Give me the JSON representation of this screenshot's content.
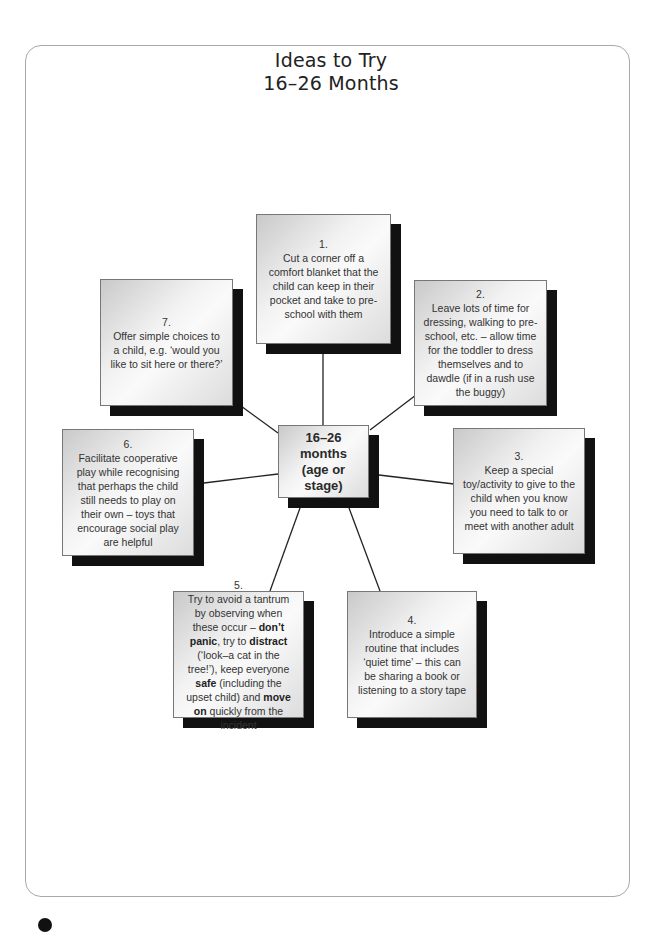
{
  "title": {
    "line1": "Ideas to Try",
    "line2": "16–26 Months"
  },
  "center": {
    "line1": "16–26",
    "line2": "months",
    "line3": "(age or stage)"
  },
  "ideas": [
    {
      "number": "1.",
      "segments": [
        {
          "text": "Cut a corner off a comfort blanket that the child can keep in their pocket and take to pre-school with them",
          "bold": false
        }
      ]
    },
    {
      "number": "2.",
      "segments": [
        {
          "text": "Leave lots of time for dressing, walking to pre-school, etc. – allow time for the toddler to dress themselves and to dawdle (if in a rush use the buggy)",
          "bold": false
        }
      ]
    },
    {
      "number": "3.",
      "segments": [
        {
          "text": "Keep a special toy/activity to give to the child when you know you need to talk to or meet with another adult",
          "bold": false
        }
      ]
    },
    {
      "number": "4.",
      "segments": [
        {
          "text": "Introduce a simple routine that includes ‘quiet time’ – this can be sharing a book or listening to a story tape",
          "bold": false
        }
      ]
    },
    {
      "number": "5.",
      "segments": [
        {
          "text": "Try to avoid a tantrum by observing when these occur – ",
          "bold": false
        },
        {
          "text": "don’t panic",
          "bold": true
        },
        {
          "text": ", try to ",
          "bold": false
        },
        {
          "text": "distract",
          "bold": true
        },
        {
          "text": " (‘look–a cat in the tree!’), keep everyone ",
          "bold": false
        },
        {
          "text": "safe",
          "bold": true
        },
        {
          "text": " (including the upset child) and ",
          "bold": false
        },
        {
          "text": "move on",
          "bold": true
        },
        {
          "text": " quickly from the incident",
          "bold": false
        }
      ]
    },
    {
      "number": "6.",
      "segments": [
        {
          "text": "Facilitate cooperative play while recognising that perhaps the child still needs to play on their own – toys that encourage social play are helpful",
          "bold": false
        }
      ]
    },
    {
      "number": "7.",
      "segments": [
        {
          "text": "Offer simple choices to a child, e.g. ‘would you like to sit here or there?’",
          "bold": false
        }
      ]
    }
  ],
  "colors": {
    "frame": "#a8a8a8",
    "shadow": "#111111",
    "connector": "#222222",
    "text": "#333333"
  }
}
